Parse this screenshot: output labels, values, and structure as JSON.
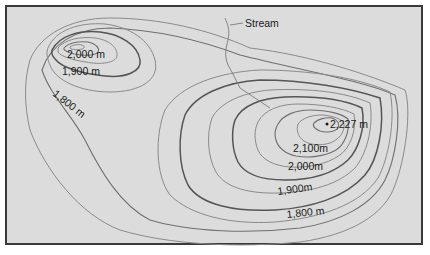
{
  "map": {
    "type": "topographic-contour-map",
    "background_color": "#dcdcdc",
    "border_color": "#3a3a3a",
    "contour_color": "#6f6f6f",
    "labels": {
      "stream": "Stream",
      "left_peak_2000": "2,000 m",
      "left_peak_1900": "1,900 m",
      "left_1800": "1,800 m",
      "right_peak": "2,227 m",
      "right_2100": "2,100m",
      "right_2000": "2,000m",
      "right_1900": "1,900m",
      "right_1800": "1,800 m"
    },
    "features": {
      "peaks": [
        {
          "name": "left-summit",
          "elevation_label": "2,000 m"
        },
        {
          "name": "right-summit",
          "elevation_label": "2,227 m"
        }
      ],
      "contour_interval_m": 100,
      "stream_label": "Stream"
    }
  }
}
